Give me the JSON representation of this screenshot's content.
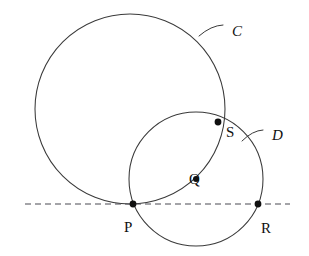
{
  "figure": {
    "kind": "geometry-diagram",
    "background_color": "#ffffff",
    "stroke_color": "#3a3a3a",
    "dash_color": "#4a4a52",
    "point_color": "#101010"
  },
  "labels": {
    "circle_c": "C",
    "circle_d": "D",
    "point_p": "P",
    "point_q": "Q",
    "point_r": "R",
    "point_s": "S"
  },
  "chart_data": {
    "type": "scatter",
    "title": "",
    "xlabel": "",
    "ylabel": "",
    "circles": [
      {
        "name": "C",
        "center": [
          130,
          109
        ],
        "radius": 95,
        "label": "C",
        "label_position": [
          232,
          24
        ],
        "note": "large circle, tangent to the dashed line at P"
      },
      {
        "name": "D",
        "center": [
          196,
          179
        ],
        "radius": 67,
        "label": "D",
        "label_position": [
          272,
          128
        ],
        "note": "smaller circle through P, R and S; center marked Q"
      }
    ],
    "points": [
      {
        "label": "P",
        "x": 133,
        "y": 204,
        "role": "tangency of C with line; on circle D",
        "label_offset": [
          -9,
          16
        ]
      },
      {
        "label": "Q",
        "x": 196,
        "y": 179,
        "role": "center of circle D",
        "label_offset": [
          -7,
          -7
        ]
      },
      {
        "label": "R",
        "x": 258,
        "y": 204,
        "role": "second intersection of circle D with the line",
        "label_offset": [
          3,
          17
        ]
      },
      {
        "label": "S",
        "x": 218,
        "y": 122,
        "role": "intersection of circles C and D",
        "label_offset": [
          8,
          3
        ]
      }
    ],
    "lines": [
      {
        "name": "tangent-line",
        "style": "dashed",
        "from": [
          25,
          204
        ],
        "to": [
          290,
          204
        ],
        "note": "horizontal dashed line through P and R"
      }
    ],
    "leaders": [
      {
        "name": "leader-c",
        "from": [
          199,
          36
        ],
        "to": [
          223,
          25
        ],
        "targets": "C"
      },
      {
        "name": "leader-d",
        "from": [
          242,
          141
        ],
        "to": [
          263,
          130
        ],
        "targets": "D"
      }
    ]
  }
}
